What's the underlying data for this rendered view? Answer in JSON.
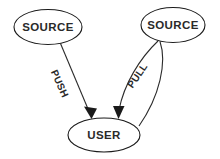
{
  "diagram": {
    "type": "node-edge-diagram",
    "background_color": "#ffffff",
    "stroke_color": "#2b2b2b",
    "text_color": "#2a2a2a",
    "nodes": [
      {
        "id": "source-left",
        "label": "SOURCE",
        "shape": "ellipse",
        "cx": 48,
        "cy": 27,
        "rx": 34,
        "ry": 17.5
      },
      {
        "id": "source-right",
        "label": "SOURCE",
        "shape": "ellipse",
        "cx": 173,
        "cy": 25,
        "rx": 32,
        "ry": 17.5
      },
      {
        "id": "user",
        "label": "USER",
        "shape": "ellipse",
        "cx": 104,
        "cy": 135,
        "rx": 36,
        "ry": 17
      }
    ],
    "edges": [
      {
        "id": "push-edge",
        "label": "PUSH",
        "from": "source-left",
        "to": "user",
        "style": "straight",
        "arrow_at": "user",
        "label_rotation_deg": 66
      },
      {
        "id": "pull-edge",
        "label": "PULL",
        "from": "source-right",
        "to": "user",
        "style": "curved",
        "arrow_at": "user",
        "label_rotation_deg": -56
      },
      {
        "id": "return-edge",
        "label": "",
        "from": "user",
        "to": "source-right",
        "style": "curved",
        "arrow_at": "none"
      }
    ]
  }
}
